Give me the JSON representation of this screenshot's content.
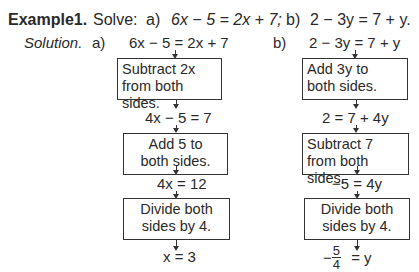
{
  "header": {
    "label": "Example1.",
    "prompt": "Solve:",
    "part_a_label": "a)",
    "part_a_eq": "6x − 5 = 2x + 7;",
    "part_b_label": "b)",
    "part_b_eq": "2 − 3y = 7 + y."
  },
  "solution_label": "Solution.",
  "part_a": {
    "label": "a)",
    "equation_start": "6x − 5 = 2x + 7",
    "steps": [
      {
        "box": [
          "Subtract 2x",
          "from both sides."
        ],
        "result": "4x − 5 = 7"
      },
      {
        "box": [
          "Add 5 to",
          "both sides."
        ],
        "result": "4x = 12"
      },
      {
        "box": [
          "Divide both",
          "sides by 4."
        ],
        "result": "x = 3"
      }
    ]
  },
  "part_b": {
    "label": "b)",
    "equation_start": "2 − 3y = 7 + y",
    "steps": [
      {
        "box": [
          "Add 3y to",
          "both sides."
        ],
        "result": "2 = 7 + 4y"
      },
      {
        "box": [
          "Subtract 7",
          "from both sides."
        ],
        "result": "−5 = 4y"
      },
      {
        "box": [
          "Divide both",
          "sides by 4."
        ],
        "result_neg": "−",
        "result_num": "5",
        "result_den": "4",
        "result_rhs": "= y"
      }
    ]
  }
}
